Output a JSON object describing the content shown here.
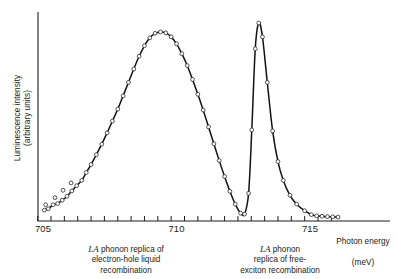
{
  "figure": {
    "kind": "luminescence-spectrum",
    "axis_title_line1": "Photon energy",
    "axis_title_line2": "(meV)",
    "ylabel_line1": "Luminescence intensity",
    "ylabel_line2": "(arbitrary units)",
    "caption_left": {
      "emphasis": "LA",
      "rest": " phonon replica of\nelectron-hole liquid\nrecombination"
    },
    "caption_right": {
      "emphasis": "LA",
      "rest": " phonon\nreplica of free-\nexciton recombination"
    },
    "colors": {
      "curve": "#111111",
      "axis": "#1d1d1d",
      "marker_fill": "#ffffff",
      "marker_stroke": "#2a2a2a",
      "background": "#ffffff"
    }
  },
  "chart_data": {
    "type": "line",
    "title": "",
    "subtitle": "",
    "xlabel": "Photon energy (meV)",
    "ylabel": "Luminescence intensity (arbitrary units)",
    "xlim": [
      704.8,
      716.2
    ],
    "ylim": [
      0,
      1.05
    ],
    "grid": false,
    "legend": null,
    "x_ticks_major": [
      705,
      710,
      715
    ],
    "x_tick_labels": [
      "705",
      "710",
      "715"
    ],
    "x_tick_minor_step": 0.5,
    "y_ticks": [],
    "marker_style": "open-circle",
    "annotations": [
      {
        "text": "LA phonon replica of electron-hole liquid recombination",
        "points_to_x": 709.6,
        "position": "below-axis-left"
      },
      {
        "text": "LA phonon replica of free-exciton recombination",
        "points_to_x": 712.9,
        "position": "below-axis-right"
      }
    ],
    "peaks": [
      {
        "name": "electron-hole liquid",
        "x": 709.6,
        "y": 0.955,
        "fwhm": 2.05
      },
      {
        "name": "free exciton",
        "x": 712.9,
        "y": 1.0,
        "fwhm": 0.72
      }
    ],
    "series": [
      {
        "name": "measured luminescence",
        "type": "scatter+line",
        "x": [
          705.05,
          705.2,
          705.38,
          705.55,
          705.72,
          705.9,
          706.08,
          706.26,
          706.45,
          706.62,
          706.8,
          707.0,
          707.2,
          707.4,
          707.6,
          707.8,
          708.0,
          708.2,
          708.4,
          708.6,
          708.8,
          709.0,
          709.2,
          709.4,
          709.6,
          709.8,
          710.0,
          710.2,
          710.4,
          710.6,
          710.8,
          711.0,
          711.2,
          711.4,
          711.6,
          711.8,
          712.0,
          712.2,
          712.4,
          712.55,
          712.7,
          712.82,
          712.95,
          713.08,
          713.22,
          713.4,
          713.6,
          713.8,
          714.0,
          714.25,
          714.5,
          714.8,
          715.05,
          715.25,
          715.45,
          715.65,
          715.85,
          716.05
        ],
        "y": [
          0.055,
          0.062,
          0.082,
          0.088,
          0.105,
          0.125,
          0.152,
          0.178,
          0.205,
          0.245,
          0.285,
          0.335,
          0.388,
          0.445,
          0.505,
          0.565,
          0.632,
          0.7,
          0.768,
          0.832,
          0.885,
          0.925,
          0.948,
          0.955,
          0.95,
          0.93,
          0.895,
          0.845,
          0.785,
          0.715,
          0.64,
          0.56,
          0.475,
          0.39,
          0.305,
          0.225,
          0.15,
          0.085,
          0.04,
          0.035,
          0.14,
          0.46,
          0.87,
          1.0,
          0.93,
          0.7,
          0.455,
          0.3,
          0.205,
          0.13,
          0.085,
          0.052,
          0.032,
          0.026,
          0.024,
          0.022,
          0.021,
          0.02
        ]
      },
      {
        "name": "outlier points below curve",
        "type": "scatter",
        "x": [
          705.1,
          705.45,
          705.75,
          706.05
        ],
        "y": [
          0.082,
          0.118,
          0.155,
          0.192
        ]
      }
    ]
  }
}
